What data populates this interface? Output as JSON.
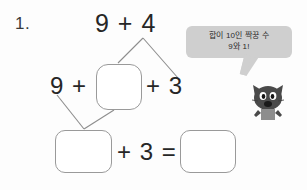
{
  "worksheet": {
    "problem_number": "1.",
    "top_expression": "9 + 4",
    "middle_left_expression": "9 +",
    "middle_right_expression": "+ 3",
    "bottom_expression": "+ 3 =",
    "answer_boxes": [
      {
        "name": "middle",
        "value": ""
      },
      {
        "name": "bottom-left",
        "value": ""
      },
      {
        "name": "bottom-right",
        "value": ""
      }
    ]
  },
  "hint": {
    "bubble_lines": [
      "합이 10인 짝꿍 수",
      "9와 1!"
    ],
    "bubble_color": "#cfcfcf",
    "character": "cat-character"
  },
  "colors": {
    "page_background": "#fdfdfd",
    "ink": "#262626",
    "box_border": "#9a9a9a",
    "connector": "#8d8d8d",
    "cat_body": "#4a4a4a"
  }
}
